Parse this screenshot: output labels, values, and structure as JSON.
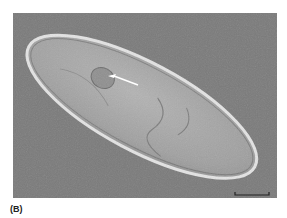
{
  "figure": {
    "panel_label": "(B)",
    "annotations": {
      "arrow": "white arrow pointing to contractile vacuole",
      "scale_bar": "unlabeled scale bar, bottom-right"
    },
    "colors": {
      "background": "#7a7a7a",
      "cell_body": "#a9a9a9",
      "cell_edge": "#e6e6e6",
      "arrow": "#ffffff",
      "scale_bar": "#222222"
    }
  }
}
